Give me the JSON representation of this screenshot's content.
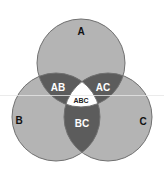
{
  "diagram": {
    "type": "venn",
    "sets": [
      {
        "id": "A",
        "label": "A",
        "cx": 81,
        "cy": 63,
        "r": 44
      },
      {
        "id": "B",
        "label": "B",
        "cx": 56,
        "cy": 117,
        "r": 44
      },
      {
        "id": "C",
        "label": "C",
        "cx": 108,
        "cy": 117,
        "r": 44
      }
    ],
    "regions": {
      "AB": "AB",
      "AC": "AC",
      "BC": "BC",
      "ABC": "ABC"
    },
    "colors": {
      "single": "#b4b4b4",
      "pair": "#5c5c5c",
      "triple": "#ffffff",
      "outline": "#707070",
      "set_label": "#111111",
      "region_label": "#ffffff",
      "center_label": "#222222"
    }
  }
}
